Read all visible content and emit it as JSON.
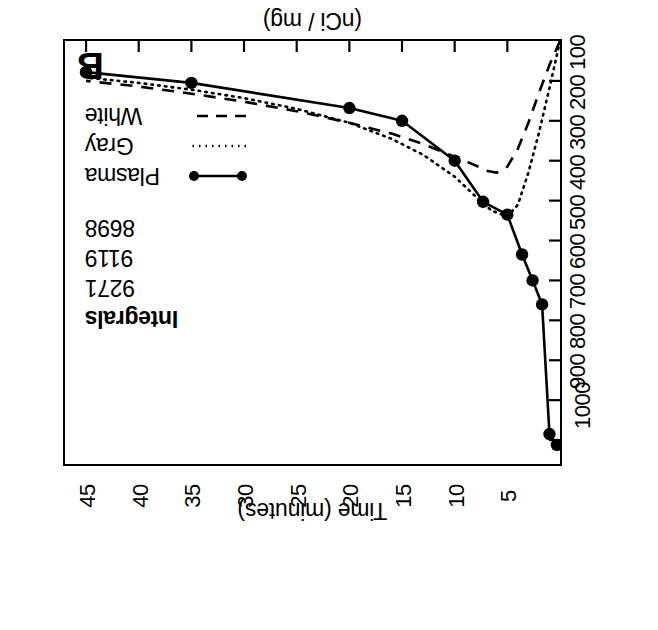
{
  "figure": {
    "panel_letter": "B",
    "orientation_degrees": 180
  },
  "legend": {
    "header": "Integrals",
    "entries": [
      {
        "name": "Plasma",
        "integral": "9271",
        "style": "solid-with-markers"
      },
      {
        "name": "Gray",
        "integral": "9119",
        "style": "dotted"
      },
      {
        "name": "White",
        "integral": "8698",
        "style": "dashed"
      }
    ]
  },
  "axes": {
    "x_title": "Time (minutes)",
    "x_ticks": [
      "5",
      "10",
      "15",
      "20",
      "25",
      "30",
      "35",
      "40",
      "45"
    ],
    "y_title_line1": "[ ",
    "y_title_sup": "14",
    "y_title_line2": "C] Deoxyglucose] / [Glucose]",
    "y_title_units": "(nCi / mg)",
    "y_ticks": [
      "100",
      "200",
      "300",
      "400",
      "500",
      "600",
      "700",
      "800",
      "900",
      "1000"
    ]
  },
  "chart_data": {
    "type": "line",
    "title": "B",
    "xlabel": "Time (minutes)",
    "ylabel": "[14C] Deoxyglucose] / [Glucose] (nCi / mg)",
    "xlim": [
      0,
      47
    ],
    "ylim": [
      0,
      1060
    ],
    "grid": false,
    "legend_position": "upper-right",
    "x_ticks": [
      5,
      10,
      15,
      20,
      25,
      30,
      35,
      40,
      45
    ],
    "y_ticks": [
      100,
      200,
      300,
      400,
      500,
      600,
      700,
      800,
      900,
      1000
    ],
    "annotations": [
      {
        "text": "Integrals",
        "role": "legend-header"
      },
      {
        "text": "9271",
        "role": "integral",
        "series": "Plasma"
      },
      {
        "text": "9119",
        "role": "integral",
        "series": "Gray"
      },
      {
        "text": "8698",
        "role": "integral",
        "series": "White"
      }
    ],
    "series": [
      {
        "name": "Plasma",
        "style": "solid",
        "marker": "filled-circle",
        "integral": 9271,
        "x": [
          0.3,
          1.0,
          1.7,
          2.6,
          3.6,
          5.0,
          7.3,
          10.0,
          15.0,
          20.0,
          35.0,
          45.0
        ],
        "y": [
          1012,
          985,
          660,
          600,
          535,
          435,
          403,
          300,
          200,
          168,
          105,
          78
        ]
      },
      {
        "name": "Gray",
        "style": "dotted",
        "marker": "none",
        "integral": 9119,
        "x": [
          0.0,
          1.0,
          2.0,
          3.0,
          4.0,
          5.0,
          6.5,
          8.0,
          10.0,
          13.0,
          16.0,
          20.0,
          25.0,
          30.0,
          35.0,
          40.0,
          45.0
        ],
        "y": [
          0,
          118,
          230,
          330,
          410,
          440,
          425,
          390,
          340,
          285,
          245,
          205,
          170,
          143,
          122,
          105,
          92
        ]
      },
      {
        "name": "White",
        "style": "dashed",
        "marker": "none",
        "integral": 8698,
        "x": [
          0.0,
          1.0,
          2.0,
          3.0,
          4.0,
          5.0,
          6.0,
          7.0,
          8.0,
          10.0,
          13.0,
          16.0,
          20.0,
          25.0,
          30.0,
          35.0,
          40.0,
          45.0
        ],
        "y": [
          0,
          60,
          130,
          205,
          270,
          315,
          330,
          325,
          312,
          290,
          258,
          232,
          205,
          176,
          152,
          132,
          114,
          100
        ]
      }
    ]
  }
}
